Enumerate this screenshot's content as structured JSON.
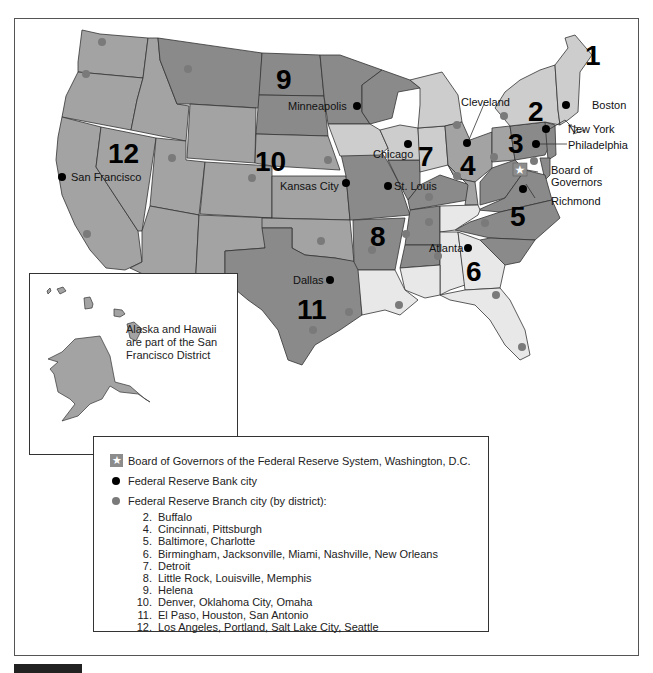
{
  "map": {
    "title_note": "Federal Reserve Districts",
    "district_numbers": [
      "1",
      "2",
      "3",
      "4",
      "5",
      "6",
      "7",
      "8",
      "9",
      "10",
      "11",
      "12"
    ],
    "bank_cities": {
      "boston": "Boston",
      "new_york": "New York",
      "philadelphia": "Philadelphia",
      "cleveland": "Cleveland",
      "richmond": "Richmond",
      "atlanta": "Atlanta",
      "chicago": "Chicago",
      "st_louis": "St. Louis",
      "minneapolis": "Minneapolis",
      "kansas_city": "Kansas City",
      "dallas": "Dallas",
      "san_francisco": "San Francisco"
    },
    "board_label_line1": "Board of",
    "board_label_line2": "Governors",
    "colors": {
      "dark": "#8a8a8a",
      "medium": "#a3a3a3",
      "light": "#cdcdcd",
      "lightest": "#e8e8e8",
      "bank_dot": "#000000",
      "branch_dot": "#7a7a7a",
      "border": "#333333"
    }
  },
  "inset": {
    "note_line1": "Alaska and Hawaii",
    "note_line2": "are part of the San",
    "note_line3": "Francisco District"
  },
  "legend": {
    "board": "Board of Governors of the Federal Reserve System, Washington, D.C.",
    "bank_city": "Federal Reserve Bank city",
    "branch_city": "Federal Reserve Branch city (by district):",
    "branches": [
      {
        "num": "2.",
        "cities": "Buffalo"
      },
      {
        "num": "4.",
        "cities": "Cincinnati, Pittsburgh"
      },
      {
        "num": "5.",
        "cities": "Baltimore, Charlotte"
      },
      {
        "num": "6.",
        "cities": "Birmingham, Jacksonville, Miami, Nashville, New Orleans"
      },
      {
        "num": "7.",
        "cities": "Detroit"
      },
      {
        "num": "8.",
        "cities": "Little Rock, Louisville, Memphis"
      },
      {
        "num": "9.",
        "cities": "Helena"
      },
      {
        "num": "10.",
        "cities": "Denver, Oklahoma City, Omaha"
      },
      {
        "num": "11.",
        "cities": "El Paso, Houston, San Antonio"
      },
      {
        "num": "12.",
        "cities": "Los Angeles, Portland, Salt Lake City, Seattle"
      }
    ]
  }
}
